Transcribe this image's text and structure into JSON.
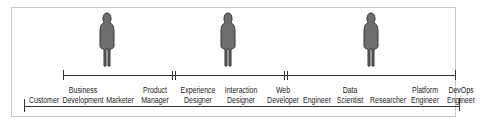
{
  "diagram": {
    "personas": [
      {
        "name": "persona-1",
        "x": 107
      },
      {
        "name": "persona-2",
        "x": 228
      },
      {
        "name": "persona-3",
        "x": 371
      }
    ],
    "upper_line_labels": [],
    "roles": [
      {
        "label": "Customer",
        "x": 44,
        "row": "single"
      },
      {
        "label": "Business\nDevelopment",
        "x": 83,
        "row": "double"
      },
      {
        "label": "Marketer",
        "x": 120,
        "row": "single"
      },
      {
        "label": "Product\nManager",
        "x": 155,
        "row": "double"
      },
      {
        "label": "Experience\nDesigner",
        "x": 198,
        "row": "double"
      },
      {
        "label": "Interaction\nDesigner",
        "x": 241,
        "row": "double"
      },
      {
        "label": "Web\nDeveloper",
        "x": 283,
        "row": "double"
      },
      {
        "label": "Engineer",
        "x": 317,
        "row": "single"
      },
      {
        "label": "Data\nScientist",
        "x": 350,
        "row": "double"
      },
      {
        "label": "Researcher",
        "x": 388,
        "row": "single"
      },
      {
        "label": "Platform\nEngineer",
        "x": 425,
        "row": "double"
      },
      {
        "label": "DevOps\nEngineer",
        "x": 461,
        "row": "double"
      }
    ]
  }
}
